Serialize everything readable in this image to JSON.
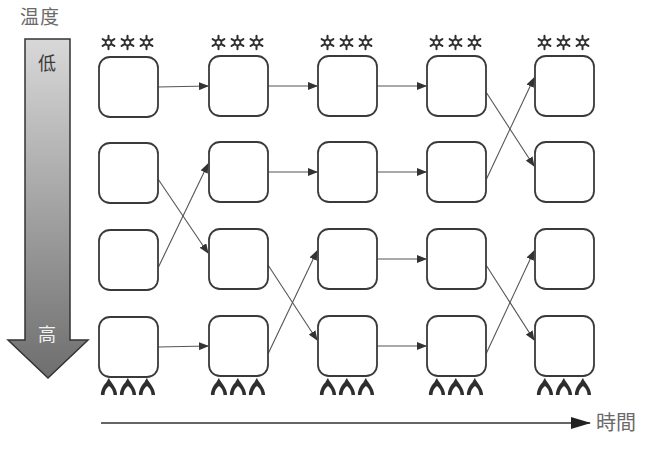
{
  "labels": {
    "temperature_axis": "温度",
    "low": "低",
    "high": "高",
    "time_axis": "時間"
  },
  "colors": {
    "box_stroke": "#3a3a3a",
    "arrow_stroke": "#555555",
    "gradient_top": "#d8d8d8",
    "gradient_bottom": "#6e6e6e",
    "icon": "#2e2e2e"
  },
  "icons": {
    "top": "snowflake-icon",
    "bottom": "flame-icon",
    "per_column": 3
  },
  "grid": {
    "columns_x": [
      99,
      209,
      318,
      427,
      535
    ],
    "rows_y": [
      57,
      143,
      230,
      317
    ],
    "box_width": 59,
    "box_height": 60
  },
  "transitions": [
    {
      "from_col": 0,
      "pairs": [
        [
          0,
          0
        ],
        [
          1,
          2
        ],
        [
          2,
          1
        ],
        [
          3,
          3
        ]
      ]
    },
    {
      "from_col": 1,
      "pairs": [
        [
          0,
          0
        ],
        [
          1,
          1
        ],
        [
          2,
          3
        ],
        [
          3,
          2
        ]
      ]
    },
    {
      "from_col": 2,
      "pairs": [
        [
          0,
          0
        ],
        [
          1,
          1
        ],
        [
          2,
          2
        ],
        [
          3,
          3
        ]
      ]
    },
    {
      "from_col": 3,
      "pairs": [
        [
          0,
          1
        ],
        [
          1,
          0
        ],
        [
          2,
          3
        ],
        [
          3,
          2
        ]
      ]
    }
  ]
}
